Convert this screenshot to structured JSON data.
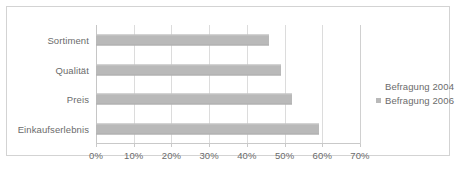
{
  "chart_data": {
    "type": "bar",
    "orientation": "horizontal",
    "title": "",
    "xlabel": "",
    "ylabel": "",
    "categories": [
      "Sortiment",
      "Qualität",
      "Preis",
      "Einkaufserlebnis"
    ],
    "series": [
      {
        "name": "Befragung 2004",
        "color": "#ffffff",
        "values": [
          null,
          null,
          null,
          null
        ]
      },
      {
        "name": "Befragung 2006",
        "color": "#b9b9b9",
        "values": [
          46,
          49,
          52,
          59
        ]
      }
    ],
    "values": [
      46,
      49,
      52,
      59
    ],
    "xlim": [
      0,
      70
    ],
    "xticks": [
      0,
      10,
      20,
      30,
      40,
      50,
      60,
      70
    ],
    "xtick_labels": [
      "0%",
      "10%",
      "20%",
      "30%",
      "40%",
      "50%",
      "60%",
      "70%"
    ],
    "grid": true,
    "grid_axis": "x",
    "legend_position": "right",
    "legend": [
      "Befragung 2004",
      "Befragung 2006"
    ]
  },
  "colors": {
    "bar_fill": "#b9b9b9",
    "gridline": "#dcdcdc",
    "axis": "#c9c9c9",
    "frame_border": "#d3d3d3",
    "text": "#6b6b6b",
    "background": "#ffffff"
  }
}
